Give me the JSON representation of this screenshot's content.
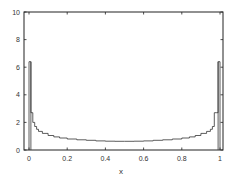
{
  "chart_data": {
    "type": "bar",
    "subtype": "histogram-step",
    "title": "",
    "xlabel": "x",
    "ylabel": "",
    "xlim": [
      -0.02,
      1.02
    ],
    "ylim": [
      0,
      10
    ],
    "xticks": [
      0,
      0.2,
      0.4,
      0.6,
      0.8,
      1
    ],
    "xtick_labels": [
      "0",
      "0.2",
      "0.4",
      "0.6",
      "0.8",
      "1"
    ],
    "yticks": [
      0,
      2,
      4,
      6,
      8,
      10
    ],
    "ytick_labels": [
      "0",
      "2",
      "4",
      "6",
      "8",
      "10"
    ],
    "grid": false,
    "legend": null,
    "series": [
      {
        "name": "density",
        "bin_edges": [
          0,
          0.01,
          0.02,
          0.03,
          0.04,
          0.05,
          0.07,
          0.1,
          0.13,
          0.16,
          0.2,
          0.25,
          0.3,
          0.35,
          0.4,
          0.45,
          0.5,
          0.55,
          0.6,
          0.65,
          0.7,
          0.75,
          0.8,
          0.84,
          0.87,
          0.9,
          0.93,
          0.95,
          0.96,
          0.97,
          0.98,
          0.99,
          1.0
        ],
        "values": [
          6.4,
          2.7,
          2.0,
          1.7,
          1.5,
          1.35,
          1.2,
          1.05,
          0.95,
          0.87,
          0.8,
          0.74,
          0.7,
          0.66,
          0.64,
          0.63,
          0.63,
          0.64,
          0.66,
          0.7,
          0.74,
          0.8,
          0.87,
          0.95,
          1.05,
          1.2,
          1.35,
          1.5,
          1.7,
          2.7,
          2.7,
          6.4
        ]
      }
    ],
    "colors": {
      "line": "#333333",
      "axis": "#222222"
    }
  },
  "axes": {
    "x_label": "x",
    "x_tick_labels": [
      "0",
      "0.2",
      "0.4",
      "0.6",
      "0.8",
      "1"
    ],
    "y_tick_labels": [
      "0",
      "2",
      "4",
      "6",
      "8",
      "10"
    ]
  }
}
